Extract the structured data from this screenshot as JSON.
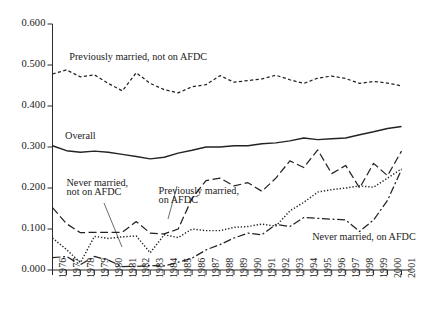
{
  "chart_data": {
    "type": "line",
    "title": "",
    "subtitle": "",
    "xlabel": "",
    "ylabel": "",
    "xlim": [
      1976,
      2001
    ],
    "ylim": [
      0.0,
      0.6
    ],
    "grid": false,
    "legend_position": "inline-annotations",
    "x": [
      1976,
      1977,
      1978,
      1979,
      1980,
      1981,
      1982,
      1983,
      1984,
      1985,
      1986,
      1987,
      1988,
      1989,
      1990,
      1991,
      1992,
      1993,
      1994,
      1995,
      1996,
      1997,
      1998,
      1999,
      2000,
      2001
    ],
    "ytick_labels": [
      "0.000",
      "0.100",
      "0.200",
      "0.300",
      "0.400",
      "0.500",
      "0.600"
    ],
    "ytick_values": [
      0.0,
      0.1,
      0.2,
      0.3,
      0.4,
      0.5,
      0.6
    ],
    "xtick_labels": [
      "1976",
      "1977",
      "1978",
      "1979",
      "1980",
      "1981",
      "1982",
      "1983",
      "1984",
      "1985",
      "1986",
      "1987",
      "1988",
      "1989",
      "1990",
      "1991",
      "1992",
      "1993",
      "1994",
      "1995",
      "1996",
      "1997",
      "1998",
      "1999",
      "2000",
      "2001"
    ],
    "series": [
      {
        "name": "Previously married, not on AFDC",
        "style": "dashed",
        "label_text": "Previously married, not on AFDC",
        "values": [
          0.478,
          0.488,
          0.471,
          0.476,
          0.455,
          0.437,
          0.481,
          0.455,
          0.44,
          0.432,
          0.447,
          0.452,
          0.474,
          0.458,
          0.462,
          0.466,
          0.475,
          0.464,
          0.455,
          0.468,
          0.473,
          0.467,
          0.455,
          0.46,
          0.456,
          0.449
        ]
      },
      {
        "name": "Overall",
        "style": "solid",
        "label_text": "Overall",
        "values": [
          0.303,
          0.291,
          0.287,
          0.29,
          0.287,
          0.282,
          0.277,
          0.271,
          0.275,
          0.285,
          0.292,
          0.3,
          0.3,
          0.303,
          0.303,
          0.308,
          0.31,
          0.315,
          0.322,
          0.318,
          0.32,
          0.322,
          0.33,
          0.337,
          0.345,
          0.35
        ]
      },
      {
        "name": "Previously married, on AFDC",
        "style": "long-dash",
        "label_text": "Previously married, on AFDC",
        "values": [
          0.152,
          0.113,
          0.091,
          0.092,
          0.092,
          0.092,
          0.118,
          0.09,
          0.088,
          0.1,
          0.175,
          0.218,
          0.224,
          0.205,
          0.213,
          0.192,
          0.224,
          0.266,
          0.25,
          0.293,
          0.235,
          0.255,
          0.2,
          0.26,
          0.23,
          0.29
        ]
      },
      {
        "name": "Never married, not on AFDC",
        "style": "dotted",
        "label_text": "Never married, not on AFDC",
        "values": [
          0.078,
          0.05,
          0.018,
          0.082,
          0.077,
          0.081,
          0.083,
          0.042,
          0.086,
          0.079,
          0.1,
          0.096,
          0.096,
          0.104,
          0.106,
          0.112,
          0.107,
          0.144,
          0.165,
          0.19,
          0.196,
          0.2,
          0.205,
          0.202,
          0.224,
          0.247
        ]
      },
      {
        "name": "Never married, on AFDC",
        "style": "dash-dot",
        "label_text": "Never married, on AFDC",
        "values": [
          0.03,
          0.033,
          0.013,
          0.033,
          0.024,
          0.008,
          0.009,
          0.011,
          0.01,
          0.019,
          0.029,
          0.049,
          0.062,
          0.078,
          0.09,
          0.086,
          0.111,
          0.106,
          0.128,
          0.126,
          0.124,
          0.122,
          0.094,
          0.122,
          0.17,
          0.245
        ]
      }
    ],
    "annotations": [
      {
        "text": "Previously married, not on AFDC",
        "x": 1977.2,
        "y": 0.515
      },
      {
        "text": "Overall",
        "x": 1976.9,
        "y": 0.323
      },
      {
        "text": "Never married,",
        "x": 1977.0,
        "y": 0.207
      },
      {
        "text": "not on AFDC",
        "x": 1977.0,
        "y": 0.185
      },
      {
        "text": "Previously married,",
        "x": 1983.6,
        "y": 0.188
      },
      {
        "text": "on AFDC",
        "x": 1983.6,
        "y": 0.166
      },
      {
        "text": "Never married, on AFDC",
        "x": 1994.6,
        "y": 0.075
      }
    ]
  }
}
